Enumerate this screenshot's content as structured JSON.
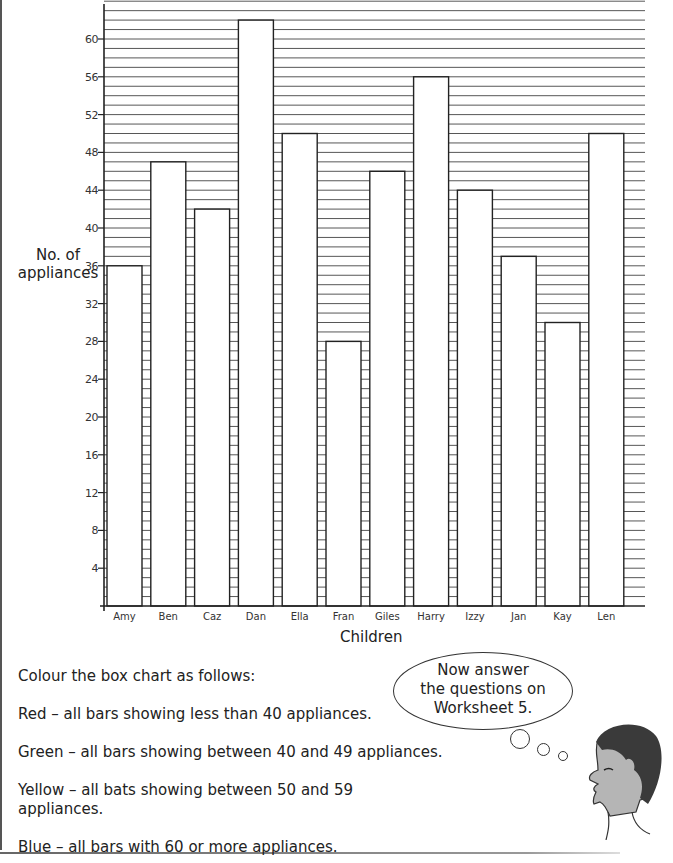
{
  "chart_data": {
    "type": "bar",
    "title": "",
    "xlabel": "Children",
    "ylabel": "No. of appliances",
    "categories": [
      "Amy",
      "Ben",
      "Caz",
      "Dan",
      "Ella",
      "Fran",
      "Giles",
      "Harry",
      "Izzy",
      "Jan",
      "Kay",
      "Len"
    ],
    "values": [
      36,
      47,
      42,
      62,
      50,
      28,
      46,
      56,
      44,
      37,
      30,
      50
    ],
    "ylim": [
      0,
      64
    ],
    "yticks": [
      4,
      8,
      12,
      16,
      20,
      24,
      28,
      32,
      36,
      40,
      44,
      48,
      52,
      56,
      60
    ],
    "grid": true,
    "grid_step": 1,
    "legend": null
  },
  "labels": {
    "ylabel_line1": "No. of",
    "ylabel_line2": "appliances",
    "xlabel": "Children"
  },
  "instructions": {
    "intro": "Colour the box chart as follows:",
    "red": "Red – all bars showing less than 40 appliances.",
    "green": "Green – all bars showing between 40 and 49 appliances.",
    "yellow_line1": "Yellow – all bats showing between 50 and 59",
    "yellow_line2": "appliances.",
    "blue": "Blue – all bars with 60 or more appliances."
  },
  "speech_bubble": {
    "line1": "Now answer",
    "line2": "the questions on",
    "line3": "Worksheet 5."
  },
  "colors": {
    "axis": "#222222",
    "gridline": "#444444",
    "bar_fill": "#ffffff",
    "bar_stroke": "#222222",
    "hair": "#3a3a3a",
    "skin": "#b5b5b5"
  }
}
